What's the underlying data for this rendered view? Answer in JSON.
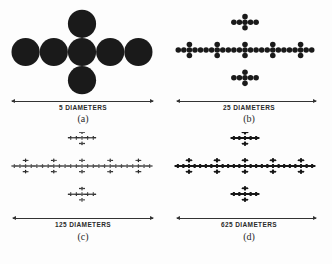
{
  "figure": {
    "ink_color": "#1a1a1a",
    "panels": [
      {
        "id": "a",
        "scale_label": "5 DIAMETERS",
        "letter": "(a)",
        "generations": 1,
        "diameters": 5
      },
      {
        "id": "b",
        "scale_label": "25 DIAMETERS",
        "letter": "(b)",
        "generations": 2,
        "diameters": 25
      },
      {
        "id": "c",
        "scale_label": "125 DIAMETERS",
        "letter": "(c)",
        "generations": 3,
        "diameters": 125
      },
      {
        "id": "d",
        "scale_label": "625 DIAMETERS",
        "letter": "(d)",
        "generations": 4,
        "diameters": 625
      }
    ]
  }
}
